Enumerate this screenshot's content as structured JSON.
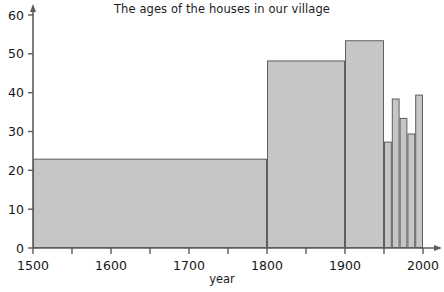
{
  "chart_data": {
    "type": "bar",
    "title": "The ages of the houses in our village",
    "xlabel": "year",
    "ylabel": "",
    "xlim": [
      1500,
      2000
    ],
    "ylim": [
      0,
      60
    ],
    "grid": false,
    "legend": null,
    "x_ticks": [
      {
        "value": 1500,
        "label": "1500",
        "major": true
      },
      {
        "value": 1550,
        "label": "",
        "major": false
      },
      {
        "value": 1600,
        "label": "1600",
        "major": true
      },
      {
        "value": 1650,
        "label": "",
        "major": false
      },
      {
        "value": 1700,
        "label": "1700",
        "major": true
      },
      {
        "value": 1750,
        "label": "",
        "major": false
      },
      {
        "value": 1800,
        "label": "1800",
        "major": true
      },
      {
        "value": 1850,
        "label": "",
        "major": false
      },
      {
        "value": 1900,
        "label": "1900",
        "major": true
      },
      {
        "value": 1950,
        "label": "",
        "major": false
      },
      {
        "value": 2000,
        "label": "2000",
        "major": true
      }
    ],
    "y_ticks": [
      {
        "value": 0,
        "label": "0"
      },
      {
        "value": 10,
        "label": "10"
      },
      {
        "value": 20,
        "label": "20"
      },
      {
        "value": 30,
        "label": "30"
      },
      {
        "value": 40,
        "label": "40"
      },
      {
        "value": 50,
        "label": "50"
      },
      {
        "value": 60,
        "label": "60"
      }
    ],
    "bars": [
      {
        "x_start": 1500,
        "x_end": 1800,
        "height": 23.0
      },
      {
        "x_start": 1800,
        "x_end": 1900,
        "height": 48.3
      },
      {
        "x_start": 1900,
        "x_end": 1950,
        "height": 53.5
      },
      {
        "x_start": 1950,
        "x_end": 1960,
        "height": 27.4
      },
      {
        "x_start": 1960,
        "x_end": 1970,
        "height": 38.5
      },
      {
        "x_start": 1970,
        "x_end": 1980,
        "height": 33.5
      },
      {
        "x_start": 1980,
        "x_end": 1990,
        "height": 29.5
      },
      {
        "x_start": 1990,
        "x_end": 2000,
        "height": 39.5
      }
    ],
    "colors": {
      "bar_fill": "#c6c6c6",
      "bar_stroke": "#5f5f5f",
      "axis": "#5c5c5c",
      "text": "#1c1c1c",
      "background": "#ffffff"
    }
  }
}
